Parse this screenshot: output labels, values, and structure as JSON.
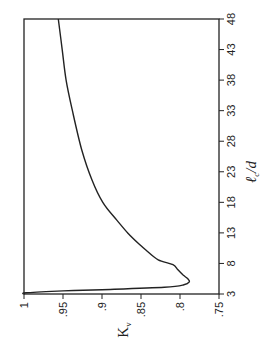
{
  "chart_data": {
    "type": "line",
    "title": "",
    "orientation_note": "figure rotated 90 degrees counter-clockwise",
    "xlabel": "ℓc/d",
    "ylabel": "Kv",
    "xlim": [
      3,
      48
    ],
    "ylim": [
      0.75,
      1
    ],
    "x_ticks": [
      3,
      8,
      13,
      18,
      23,
      28,
      33,
      38,
      43,
      48
    ],
    "x_tick_labels": [
      "3",
      "8",
      "13",
      "18",
      "23",
      "28",
      "33",
      "38",
      "43",
      "48"
    ],
    "y_ticks": [
      0.75,
      0.8,
      0.85,
      0.9,
      0.95,
      1
    ],
    "y_tick_labels": [
      ".75",
      ".8",
      ".85",
      ".9",
      ".95",
      "1"
    ],
    "grid": false,
    "legend": null,
    "series": [
      {
        "name": "Kv",
        "x": [
          3.0,
          3.2,
          3.5,
          3.7,
          4.1,
          4.5,
          5.0,
          5.5,
          6.1,
          7.0,
          7.8,
          8.6,
          10.0,
          11.0,
          13.0,
          15.1,
          18.0,
          21.7,
          26.6,
          33.0,
          38.0,
          43.0,
          48.0
        ],
        "y": [
          1.0,
          0.997,
          0.95,
          0.9,
          0.82,
          0.795,
          0.788,
          0.79,
          0.796,
          0.803,
          0.809,
          0.828,
          0.842,
          0.851,
          0.867,
          0.881,
          0.899,
          0.913,
          0.926,
          0.938,
          0.946,
          0.951,
          0.956
        ]
      }
    ]
  }
}
